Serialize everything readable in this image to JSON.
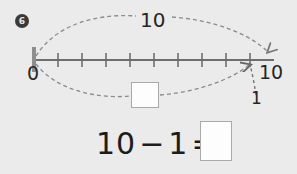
{
  "problem": {
    "number": "6",
    "type": "number-line-subtraction"
  },
  "number_line": {
    "start_label": "0",
    "end_label": "10",
    "total_jump_label": "10",
    "back_jump_label": "1",
    "missing_result_placeholder": "",
    "tick_count": 10,
    "start_value": 0,
    "end_value": 10
  },
  "equation": {
    "minuend": "10",
    "operator": "−",
    "subtrahend": "1",
    "equals": "=",
    "answer": ""
  },
  "colors": {
    "background": "#ebebeb",
    "line": "#6e6e6e",
    "arc": "#8a8a8a",
    "text": "#262626",
    "badge": "#3a3a3a",
    "box_fill": "#fdfdfd",
    "box_border": "#a9a9a9"
  }
}
